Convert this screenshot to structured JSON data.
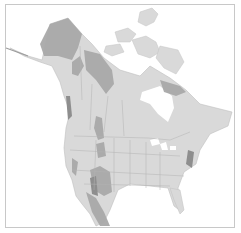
{
  "map": {
    "subject": "North America range map",
    "colors": {
      "background": "#ffffff",
      "land": "#d9d9d9",
      "range": "#a9a9a9",
      "range_dark": "#8e8e8e",
      "border": "#b8b8b8",
      "frame": "#c8c8c8"
    },
    "legend": []
  }
}
